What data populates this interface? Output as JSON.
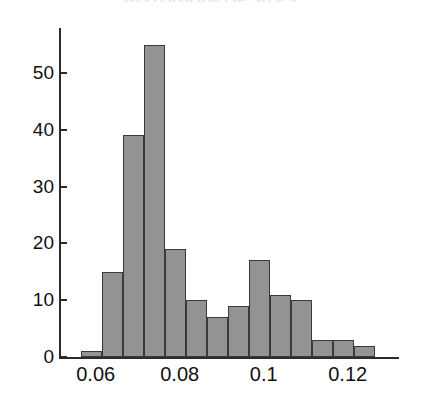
{
  "figure": {
    "title": "HISTOGRAM OF SIZES",
    "title_visible": "partially cropped at top edge"
  },
  "axes": {
    "y_ticks": [
      {
        "value": 0,
        "label": "0"
      },
      {
        "value": 10,
        "label": "10"
      },
      {
        "value": 20,
        "label": "20"
      },
      {
        "value": 30,
        "label": "30"
      },
      {
        "value": 40,
        "label": "40"
      },
      {
        "value": 50,
        "label": "50"
      }
    ],
    "x_ticks": [
      {
        "value": 0.06,
        "label": "0.06"
      },
      {
        "value": 0.08,
        "label": "0.08"
      },
      {
        "value": 0.1,
        "label": "0.1"
      },
      {
        "value": 0.12,
        "label": "0.12"
      }
    ]
  },
  "colors": {
    "bar_fill": "#939393",
    "bar_edge": "#3a3a3a",
    "axis": "#2b2b2b",
    "text": "#111111"
  },
  "chart_data": {
    "type": "bar",
    "title": "HISTOGRAM OF SIZES",
    "xlabel": "",
    "ylabel": "",
    "xlim": [
      0.055,
      0.134
    ],
    "ylim": [
      0,
      57
    ],
    "grid": false,
    "legend": null,
    "bin_width": 0.005,
    "bin_edges": [
      0.0565,
      0.0615,
      0.0665,
      0.0715,
      0.0765,
      0.0815,
      0.0865,
      0.0915,
      0.0965,
      0.1015,
      0.1065,
      0.1115,
      0.1165,
      0.1215,
      0.1265
    ],
    "categories": [
      "0.0565-0.0615",
      "0.0615-0.0665",
      "0.0665-0.0715",
      "0.0715-0.0765",
      "0.0765-0.0815",
      "0.0815-0.0865",
      "0.0865-0.0915",
      "0.0915-0.0965",
      "0.0965-0.1015",
      "0.1015-0.1065",
      "0.1065-0.1115",
      "0.1115-0.1165",
      "0.1165-0.1215",
      "0.1215-0.1265"
    ],
    "values": [
      1,
      15,
      39,
      55,
      19,
      10,
      7,
      9,
      17,
      11,
      10,
      3,
      3,
      2
    ]
  }
}
